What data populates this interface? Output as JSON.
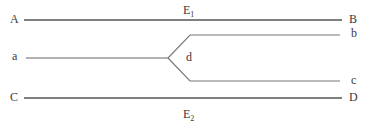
{
  "diagram": {
    "type": "strand-branching",
    "line_color": "#555555",
    "labels": {
      "A": "A",
      "B": "B",
      "a": "a",
      "b": "b",
      "c": "c",
      "d": "d",
      "C": "C",
      "D": "D",
      "E1_base": "E",
      "E1_sub": "1",
      "E2_base": "E",
      "E2_sub": "2"
    },
    "lines": [
      {
        "name": "line-A-B",
        "from": "A",
        "to": "B",
        "label": "E1"
      },
      {
        "name": "line-a-branch",
        "from": "a",
        "to": "d"
      },
      {
        "name": "branch-upper",
        "from": "d",
        "to": "b"
      },
      {
        "name": "branch-lower",
        "from": "d",
        "to": "c"
      },
      {
        "name": "line-C-D",
        "from": "C",
        "to": "D",
        "label": "E2"
      }
    ]
  }
}
